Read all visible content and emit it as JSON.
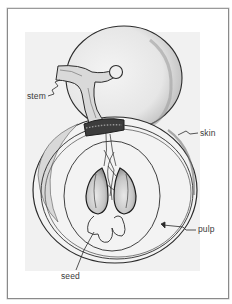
{
  "figure": {
    "title": "",
    "labels": {
      "stem": "stem",
      "skin": "skin",
      "pulp": "pulp",
      "seed": "seed"
    }
  },
  "colors": {
    "frame_border": "#8a8a8a",
    "drawing_background": "#f1f1f1",
    "ink": "#2b2b2b",
    "label_text": "#3a3a3a"
  }
}
